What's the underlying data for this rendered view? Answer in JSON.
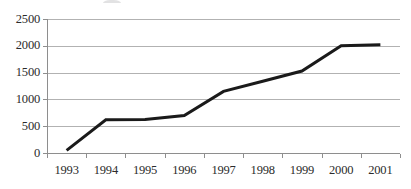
{
  "chart_data": {
    "type": "line",
    "title": "",
    "xlabel": "",
    "ylabel": "",
    "categories": [
      "1993",
      "1994",
      "1995",
      "1996",
      "1997",
      "1998",
      "1999",
      "2000",
      "2001"
    ],
    "series": [
      {
        "name": "",
        "values": [
          50,
          620,
          625,
          700,
          1150,
          1340,
          1530,
          2000,
          2020
        ]
      }
    ],
    "ylim": [
      0,
      2500
    ],
    "ytick_labels": [
      "2500",
      "2000",
      "1500",
      "1000",
      "500",
      "0"
    ],
    "ytick_values": [
      2500,
      2000,
      1500,
      1000,
      500,
      0
    ],
    "grid": "horizontal",
    "legend": "none",
    "line_color": "#1a1a1a",
    "gridline_color": "#b2b2b2",
    "axis_color": "#8e8e8e",
    "text_color": "#2b2b2b",
    "background_color": "#ffffff",
    "markers": false,
    "line_width": 3
  }
}
